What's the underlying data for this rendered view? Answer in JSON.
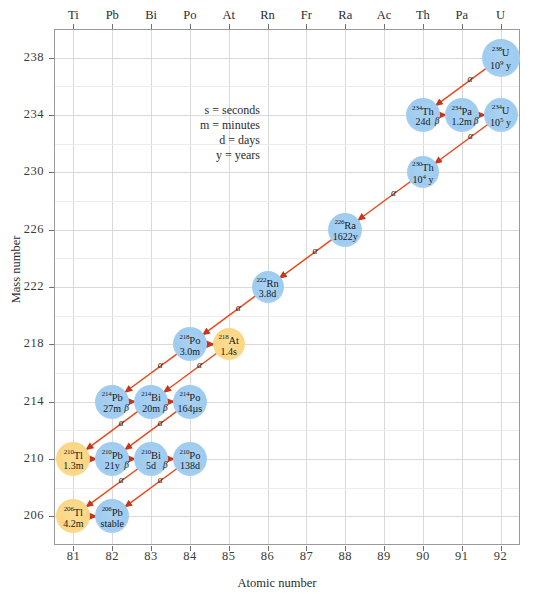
{
  "axes": {
    "xlabel": "Atomic number",
    "ylabel": "Mass number",
    "xticks": [
      "81",
      "82",
      "83",
      "84",
      "85",
      "86",
      "87",
      "88",
      "89",
      "90",
      "91",
      "92"
    ],
    "yticks": [
      "238",
      "234",
      "230",
      "226",
      "222",
      "218",
      "214",
      "210",
      "206"
    ],
    "element_symbols": [
      "Ti",
      "Pb",
      "Bi",
      "Po",
      "At",
      "Rn",
      "Fr",
      "Ra",
      "Ac",
      "Th",
      "Pa",
      "U"
    ]
  },
  "legend": {
    "line1": "s = seconds",
    "line2": "m = minutes",
    "line3": "d = days",
    "line4": "y = years"
  },
  "colors": {
    "blue_node": "#9ecbf0",
    "gold_node": "#fbd684",
    "arrow": "#e8491d",
    "grid": "#d9d9d9",
    "frame": "#9a9a9a"
  },
  "chart_data": {
    "type": "scatter",
    "title": "",
    "xlabel": "Atomic number",
    "ylabel": "Mass number",
    "xlim": [
      80.5,
      92.5
    ],
    "ylim": [
      204,
      240
    ],
    "grid": true,
    "legend_position": "none",
    "nodes": [
      {
        "id": "U238",
        "mass": "238",
        "element": "U",
        "half_life": "10",
        "exp": "9",
        "unit": "y",
        "z": 92,
        "a": 238,
        "color": "blue",
        "r": 19
      },
      {
        "id": "Th234",
        "mass": "234",
        "element": "Th",
        "half_life": "24d",
        "unit": "",
        "z": 90,
        "a": 234,
        "color": "blue",
        "r": 17
      },
      {
        "id": "Pa234",
        "mass": "234",
        "element": "Pa",
        "half_life": "1.2m",
        "unit": "",
        "z": 91,
        "a": 234,
        "color": "blue",
        "r": 17
      },
      {
        "id": "U234",
        "mass": "234",
        "element": "U",
        "half_life": "10",
        "exp": "5",
        "unit": "y",
        "z": 92,
        "a": 234,
        "color": "blue",
        "r": 17
      },
      {
        "id": "Th230",
        "mass": "230",
        "element": "Th",
        "half_life": "10",
        "exp": "4",
        "unit": "y",
        "z": 90,
        "a": 230,
        "color": "blue",
        "r": 16
      },
      {
        "id": "Ra226",
        "mass": "226",
        "element": "Ra",
        "half_life": "1622y",
        "unit": "",
        "z": 88,
        "a": 226,
        "color": "blue",
        "r": 17
      },
      {
        "id": "Rn222",
        "mass": "222",
        "element": "Rn",
        "half_life": "3.8d",
        "unit": "",
        "z": 86,
        "a": 222,
        "color": "blue",
        "r": 16
      },
      {
        "id": "Po218",
        "mass": "218",
        "element": "Po",
        "half_life": "3.0m",
        "unit": "",
        "z": 84,
        "a": 218,
        "color": "blue",
        "r": 17
      },
      {
        "id": "At218",
        "mass": "218",
        "element": "At",
        "half_life": "1.4s",
        "unit": "",
        "z": 85,
        "a": 218,
        "color": "gold",
        "r": 16
      },
      {
        "id": "Pb214",
        "mass": "214",
        "element": "Pb",
        "half_life": "27m",
        "unit": "",
        "z": 82,
        "a": 214,
        "color": "blue",
        "r": 17
      },
      {
        "id": "Bi214",
        "mass": "214",
        "element": "Bi",
        "half_life": "20m",
        "unit": "",
        "z": 83,
        "a": 214,
        "color": "blue",
        "r": 17
      },
      {
        "id": "Po214",
        "mass": "214",
        "element": "Po",
        "half_life": "164µs",
        "unit": "",
        "z": 84,
        "a": 214,
        "color": "blue",
        "r": 17
      },
      {
        "id": "Tl210",
        "mass": "210",
        "element": "Tl",
        "half_life": "1.3m",
        "unit": "",
        "z": 81,
        "a": 210,
        "color": "gold",
        "r": 17
      },
      {
        "id": "Pb210",
        "mass": "210",
        "element": "Pb",
        "half_life": "21y",
        "unit": "",
        "z": 82,
        "a": 210,
        "color": "blue",
        "r": 17
      },
      {
        "id": "Bi210",
        "mass": "210",
        "element": "Bi",
        "half_life": "5d",
        "unit": "",
        "z": 83,
        "a": 210,
        "color": "blue",
        "r": 17
      },
      {
        "id": "Po210",
        "mass": "210",
        "element": "Po",
        "half_life": "138d",
        "unit": "",
        "z": 84,
        "a": 210,
        "color": "blue",
        "r": 17
      },
      {
        "id": "Tl206",
        "mass": "206",
        "element": "Tl",
        "half_life": "4.2m",
        "unit": "",
        "z": 81,
        "a": 206,
        "color": "gold",
        "r": 17
      },
      {
        "id": "Pb206",
        "mass": "206",
        "element": "Pb",
        "half_life": "stable",
        "unit": "",
        "z": 82,
        "a": 206,
        "color": "blue",
        "r": 17
      }
    ],
    "decays": [
      {
        "from": "U238",
        "to": "Th234",
        "type": "alpha",
        "label": "α"
      },
      {
        "from": "Th234",
        "to": "Pa234",
        "type": "beta",
        "label": "β"
      },
      {
        "from": "Pa234",
        "to": "U234",
        "type": "beta",
        "label": "β"
      },
      {
        "from": "U234",
        "to": "Th230",
        "type": "alpha",
        "label": "α"
      },
      {
        "from": "Th230",
        "to": "Ra226",
        "type": "alpha",
        "label": "α"
      },
      {
        "from": "Ra226",
        "to": "Rn222",
        "type": "alpha",
        "label": "α"
      },
      {
        "from": "Rn222",
        "to": "Po218",
        "type": "alpha",
        "label": "α"
      },
      {
        "from": "Po218",
        "to": "At218",
        "type": "beta",
        "label": ""
      },
      {
        "from": "Po218",
        "to": "Pb214",
        "type": "alpha",
        "label": "α"
      },
      {
        "from": "At218",
        "to": "Bi214",
        "type": "alpha",
        "label": "α"
      },
      {
        "from": "Pb214",
        "to": "Bi214",
        "type": "beta",
        "label": "β"
      },
      {
        "from": "Bi214",
        "to": "Po214",
        "type": "beta",
        "label": "β"
      },
      {
        "from": "Bi214",
        "to": "Tl210",
        "type": "alpha",
        "label": "α"
      },
      {
        "from": "Po214",
        "to": "Pb210",
        "type": "alpha",
        "label": "α"
      },
      {
        "from": "Tl210",
        "to": "Pb210",
        "type": "beta",
        "label": ""
      },
      {
        "from": "Pb210",
        "to": "Bi210",
        "type": "beta",
        "label": "β"
      },
      {
        "from": "Bi210",
        "to": "Po210",
        "type": "beta",
        "label": "β"
      },
      {
        "from": "Bi210",
        "to": "Tl206",
        "type": "alpha",
        "label": "α"
      },
      {
        "from": "Po210",
        "to": "Pb206",
        "type": "alpha",
        "label": "α"
      },
      {
        "from": "Tl206",
        "to": "Pb206",
        "type": "beta",
        "label": ""
      }
    ]
  }
}
